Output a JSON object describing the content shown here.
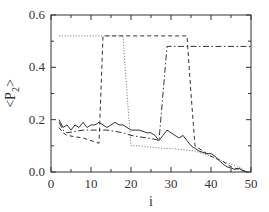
{
  "chart_data": {
    "type": "line",
    "title": "",
    "xlabel": "i",
    "ylabel": "<P2>",
    "ylabel_parts": {
      "lt": "<",
      "P": "P",
      "sub": "2",
      "gt": ">"
    },
    "xlim": [
      0,
      50
    ],
    "ylim": [
      0.0,
      0.6
    ],
    "grid": false,
    "legend": null,
    "x_ticks": [
      0,
      10,
      20,
      30,
      40,
      50
    ],
    "x_tick_labels": [
      "0",
      "10",
      "20",
      "30",
      "40",
      "50"
    ],
    "x_minor_ticks": [
      5,
      15,
      25,
      35,
      45
    ],
    "y_ticks": [
      0.0,
      0.2,
      0.4,
      0.6
    ],
    "y_tick_labels": [
      "0.0",
      "0.2",
      "0.4",
      "0.6"
    ],
    "y_minor_ticks": [
      0.1,
      0.3,
      0.5
    ],
    "series": [
      {
        "name": "solid",
        "style": "solid",
        "color": "#333333",
        "x": [
          2,
          3,
          4,
          5,
          6,
          7,
          8,
          9,
          10,
          11,
          12,
          13,
          14,
          15,
          16,
          17,
          18,
          19,
          20,
          21,
          22,
          23,
          24,
          25,
          26,
          27,
          28,
          29,
          30,
          31,
          32,
          33,
          34,
          35,
          36,
          37,
          38,
          39,
          40,
          41,
          42,
          43,
          44,
          45,
          46,
          47,
          48,
          49
        ],
        "y": [
          0.2,
          0.17,
          0.18,
          0.16,
          0.18,
          0.17,
          0.19,
          0.17,
          0.18,
          0.18,
          0.19,
          0.18,
          0.17,
          0.18,
          0.19,
          0.18,
          0.18,
          0.17,
          0.16,
          0.16,
          0.16,
          0.155,
          0.15,
          0.15,
          0.14,
          0.12,
          0.14,
          0.16,
          0.15,
          0.14,
          0.13,
          0.14,
          0.12,
          0.1,
          0.09,
          0.08,
          0.075,
          0.07,
          0.07,
          0.06,
          0.045,
          0.03,
          0.02,
          0.015,
          0.01,
          0.015,
          0.005,
          0.0
        ]
      },
      {
        "name": "dotted",
        "style": "dotted",
        "color": "#777777",
        "x": [
          2,
          18,
          19,
          20,
          22,
          25,
          28,
          30,
          33,
          36,
          40,
          43,
          45,
          47,
          49
        ],
        "y": [
          0.52,
          0.52,
          0.3,
          0.1,
          0.1,
          0.095,
          0.09,
          0.09,
          0.085,
          0.08,
          0.06,
          0.04,
          0.03,
          0.02,
          0.0
        ]
      },
      {
        "name": "dashed",
        "style": "dashed",
        "color": "#333333",
        "x": [
          2,
          3,
          4,
          6,
          8,
          10,
          12,
          13,
          14,
          16,
          18,
          20,
          22,
          25,
          28,
          30,
          33,
          34,
          35,
          36,
          38,
          40,
          43,
          45,
          47,
          49
        ],
        "y": [
          0.17,
          0.15,
          0.14,
          0.135,
          0.13,
          0.12,
          0.11,
          0.52,
          0.52,
          0.52,
          0.52,
          0.52,
          0.52,
          0.52,
          0.52,
          0.52,
          0.52,
          0.52,
          0.3,
          0.1,
          0.08,
          0.06,
          0.04,
          0.02,
          0.01,
          0.0
        ]
      },
      {
        "name": "dash-dot",
        "style": "dashdot",
        "color": "#333333",
        "x": [
          2,
          3,
          4,
          6,
          8,
          10,
          12,
          14,
          16,
          18,
          20,
          22,
          24,
          26,
          27,
          28,
          29,
          30,
          35,
          40,
          45,
          50
        ],
        "y": [
          0.19,
          0.16,
          0.15,
          0.155,
          0.16,
          0.16,
          0.16,
          0.16,
          0.155,
          0.15,
          0.14,
          0.135,
          0.13,
          0.125,
          0.12,
          0.3,
          0.48,
          0.48,
          0.48,
          0.48,
          0.48,
          0.48
        ]
      }
    ]
  },
  "plot_area": {
    "left": 51,
    "top": 15,
    "right": 251,
    "bottom": 172
  }
}
